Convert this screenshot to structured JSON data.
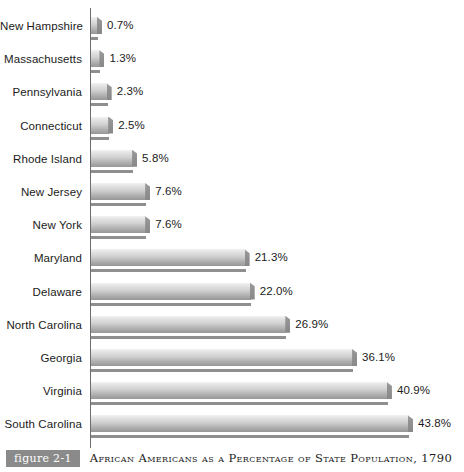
{
  "chart_data": {
    "type": "bar",
    "orientation": "horizontal",
    "title": "African Americans as a Percentage of State Population, 1790",
    "figure_label": "figure 2-1",
    "xlabel": "",
    "ylabel": "",
    "xlim": [
      0,
      43.8
    ],
    "grid": false,
    "legend": "none",
    "value_suffix": "%",
    "categories": [
      "New Hampshire",
      "Massachusetts",
      "Pennsylvania",
      "Connecticut",
      "Rhode Island",
      "New Jersey",
      "New York",
      "Maryland",
      "Delaware",
      "North Carolina",
      "Georgia",
      "Virginia",
      "South Carolina"
    ],
    "values": [
      0.7,
      1.3,
      2.3,
      2.5,
      5.8,
      7.6,
      7.6,
      21.3,
      22.0,
      26.9,
      36.1,
      40.9,
      43.8
    ],
    "value_labels": [
      "0.7%",
      "1.3%",
      "2.3%",
      "2.5%",
      "5.8%",
      "7.6%",
      "7.6%",
      "21.3%",
      "22.0%",
      "26.9%",
      "36.1%",
      "40.9%",
      "43.8%"
    ],
    "bar_color_light": "#f2f2f2",
    "bar_color_dark": "#989898",
    "axis_color": "#6d6d6d"
  },
  "caption": {
    "figure_tag": "figure 2-1",
    "text": "African Americans as a Percentage of State Population, 1790",
    "tag_background": "#8a8a8a"
  }
}
